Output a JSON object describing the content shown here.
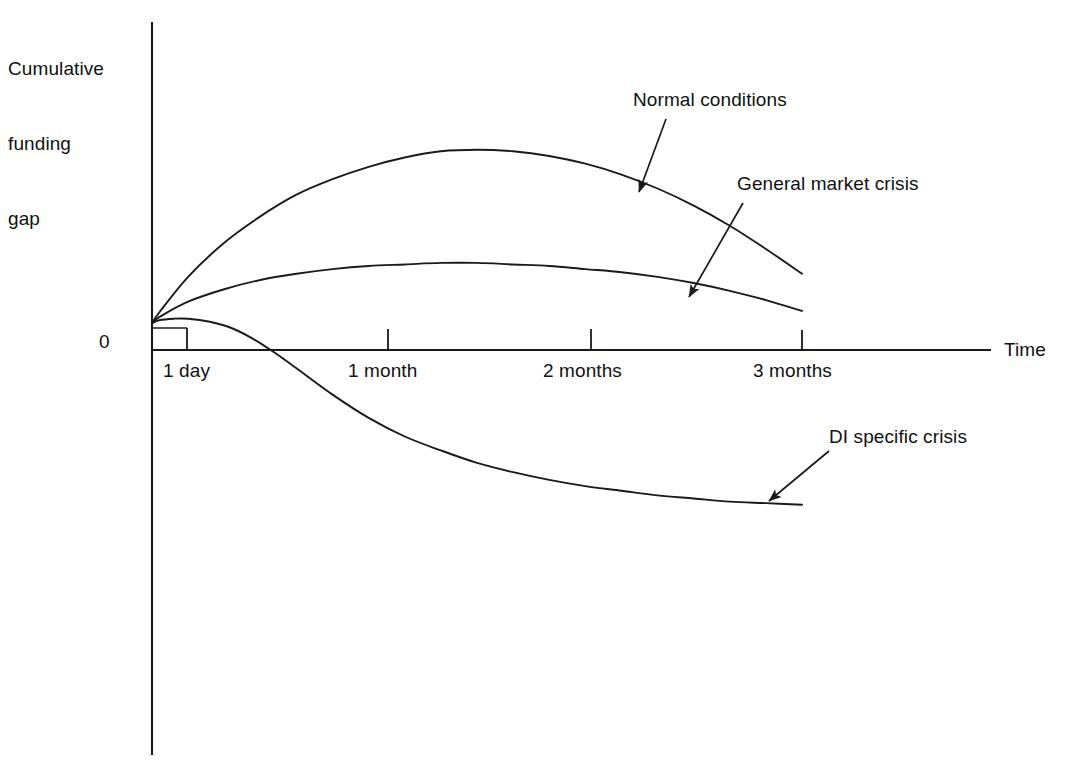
{
  "chart_data": {
    "type": "line",
    "title": "",
    "subtitle": "",
    "ylabel": "Cumulative funding gap",
    "xlabel": "Time",
    "grid": false,
    "legend_position": "inline-annotations",
    "y_zero_label": "0",
    "x_tick_labels": [
      "1 day",
      "1 month",
      "2 months",
      "3 months"
    ],
    "x_tick_values": [
      1,
      30,
      60,
      90
    ],
    "x_unit": "days",
    "xlim": [
      0,
      105
    ],
    "ylim": [
      -1.2,
      1.6
    ],
    "y_axis_has_numeric_ticks": false,
    "annotations": [
      {
        "text": "Normal conditions",
        "target_series": "Normal conditions",
        "arrow": "down-left"
      },
      {
        "text": "General market crisis",
        "target_series": "General market crisis",
        "arrow": "down-left"
      },
      {
        "text": "DI specific crisis",
        "target_series": "DI specific crisis",
        "arrow": "down-left"
      }
    ],
    "series": [
      {
        "name": "Normal conditions",
        "color": "#1a1a1a",
        "description": "Rises steeply from zero, peaks near 1.5 months, then declines; stays positive through 3 months.",
        "x": [
          0,
          1,
          5,
          10,
          15,
          20,
          25,
          30,
          35,
          40,
          45,
          50,
          55,
          60,
          65,
          70,
          75,
          80,
          85,
          90
        ],
        "values": [
          0.03,
          0.1,
          0.33,
          0.55,
          0.72,
          0.86,
          0.96,
          1.04,
          1.1,
          1.14,
          1.15,
          1.14,
          1.11,
          1.06,
          0.99,
          0.9,
          0.79,
          0.66,
          0.51,
          0.35
        ]
      },
      {
        "name": "General market crisis",
        "color": "#1a1a1a",
        "description": "Rises modestly, plateaus around 1 to 2 months, then eases back toward zero at 3 months.",
        "x": [
          0,
          1,
          5,
          10,
          15,
          20,
          25,
          30,
          35,
          40,
          45,
          50,
          55,
          60,
          65,
          70,
          75,
          80,
          85,
          90
        ],
        "values": [
          0.03,
          0.07,
          0.17,
          0.25,
          0.31,
          0.35,
          0.38,
          0.4,
          0.41,
          0.42,
          0.42,
          0.41,
          0.4,
          0.38,
          0.36,
          0.33,
          0.29,
          0.24,
          0.18,
          0.11
        ]
      },
      {
        "name": "DI specific crisis",
        "color": "#1a1a1a",
        "description": "Briefly flat near zero, crosses below zero before 1 month, falls steeply then flattens out negative by 3 months.",
        "x": [
          0,
          1,
          3,
          5,
          8,
          11,
          14,
          17,
          20,
          25,
          30,
          35,
          40,
          45,
          50,
          55,
          60,
          65,
          70,
          75,
          80,
          85,
          90
        ],
        "values": [
          0.03,
          0.05,
          0.06,
          0.06,
          0.04,
          0.0,
          -0.07,
          -0.16,
          -0.26,
          -0.43,
          -0.58,
          -0.7,
          -0.79,
          -0.87,
          -0.93,
          -0.98,
          -1.02,
          -1.05,
          -1.08,
          -1.1,
          -1.12,
          -1.13,
          -1.14
        ]
      }
    ]
  },
  "axis": {
    "y_title_lines": [
      "Cumulative",
      "funding",
      "gap"
    ],
    "y_title": "Cumulative funding gap",
    "x_title": "Time",
    "zero": "0"
  },
  "ticks": {
    "day1": "1 day",
    "month1": "1 month",
    "month2": "2 months",
    "month3": "3 months"
  },
  "annotations": {
    "normal": "Normal conditions",
    "general": "General market crisis",
    "di": "DI specific crisis"
  },
  "colors": {
    "line": "#1a1a1a",
    "axis": "#1a1a1a",
    "background": "#ffffff",
    "text": "#111111"
  }
}
